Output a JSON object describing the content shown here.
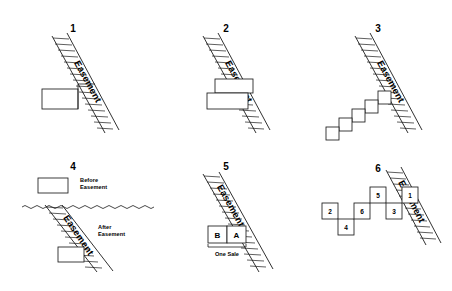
{
  "figure": {
    "title": "",
    "background_color": "#ffffff",
    "line_color": "#1a1a1a",
    "width": 452,
    "height": 291,
    "easement_label": "Easement"
  },
  "panels": [
    {
      "id": "panel-1",
      "number": "1",
      "easement_label": "Easement",
      "description": "Single rectangle overlapping the left edge of a hatched easement strip"
    },
    {
      "id": "panel-2",
      "number": "2",
      "easement_label": "Easement",
      "description": "Two stacked offset rectangles crossing the hatched easement strip"
    },
    {
      "id": "panel-3",
      "number": "3",
      "easement_label": "Easement",
      "description": "Staircase of five squares descending away from the easement strip"
    },
    {
      "id": "panel-4",
      "number": "4",
      "easement_label": "Easement",
      "before_label_line1": "Before",
      "before_label_line2": "Easement",
      "after_label_line1": "After",
      "after_label_line2": "Easement",
      "description": "Before condition rectangle above a wavy divider, after condition with easement strip below"
    },
    {
      "id": "panel-5",
      "number": "5",
      "easement_label": "Easement",
      "lot_b_label": "B",
      "lot_a_label": "A",
      "sale_label": "One Sale",
      "description": "Two adjacent lots B and A sold together in one sale across the easement"
    },
    {
      "id": "panel-6",
      "number": "6",
      "easement_label": "Easement",
      "parcels": [
        {
          "label": "2",
          "row": "middle",
          "order": 1
        },
        {
          "label": "4",
          "row": "lower",
          "order": 2
        },
        {
          "label": "6",
          "row": "middle",
          "order": 3
        },
        {
          "label": "5",
          "row": "upper",
          "order": 4
        },
        {
          "label": "3",
          "row": "middle",
          "order": 5
        },
        {
          "label": "1",
          "row": "upper",
          "order": 6
        }
      ],
      "description": "Six numbered parcels in a zigzag abutting the easement strip"
    }
  ]
}
